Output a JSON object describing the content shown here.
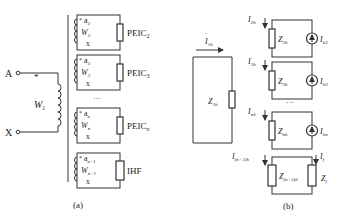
{
  "panel_a": {
    "caption": "(a)",
    "primary": {
      "terminal_top": "A",
      "terminal_bottom": "X",
      "winding": "W",
      "winding_sub": "1",
      "polarity_mark": "*"
    },
    "secondaries": [
      {
        "top": "a",
        "top_sub": "2",
        "winding": "W",
        "winding_sub": "2",
        "bottom": "x",
        "load": "PEIC",
        "load_sub": "2"
      },
      {
        "top": "a",
        "top_sub": "3",
        "winding": "W",
        "winding_sub": "3",
        "bottom": "x",
        "load": "PEIC",
        "load_sub": "3"
      },
      {
        "top": "a",
        "top_sub": "n",
        "winding": "W",
        "winding_sub": "n",
        "bottom": "x",
        "load": "PEIC",
        "load_sub": "n"
      },
      {
        "top": "a",
        "top_sub": "n+1",
        "winding": "W",
        "winding_sub": "n+1",
        "bottom": "x",
        "load": "IHF",
        "load_sub": ""
      }
    ],
    "ellipsis": "···"
  },
  "panel_b": {
    "caption": "(b)",
    "primary": {
      "current": "I",
      "current_sub": "1h",
      "impedance": "Z",
      "impedance_sub": "1h"
    },
    "loops": [
      {
        "current": "I",
        "current_sub": "2h",
        "impedance": "Z",
        "impedance_sub": "2h",
        "source": "I",
        "source_sub": "h2"
      },
      {
        "current": "I",
        "current_sub": "3h",
        "impedance": "Z",
        "impedance_sub": "3h",
        "source": "I",
        "source_sub": "h3"
      },
      {
        "current": "I",
        "current_sub": "nh",
        "impedance": "Z",
        "impedance_sub": "nh",
        "source": "I",
        "source_sub": "hn"
      },
      {
        "current": "I",
        "current_sub": "(n+1)h",
        "impedance": "Z",
        "impedance_sub": "(n+1)h",
        "load_current": "I",
        "load_current_sub": "f",
        "load": "Z",
        "load_sub": "f"
      }
    ],
    "ellipsis": "···"
  }
}
